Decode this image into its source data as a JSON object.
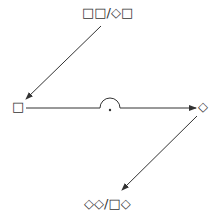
{
  "diagram": {
    "top_label": "□□/◇□",
    "bottom_label": "◇◇/□◇",
    "left_node": "□",
    "right_node": "◇",
    "arrows": [
      {
        "from": "top_label",
        "to": "left_node"
      },
      {
        "from": "left_node",
        "to": "right_node",
        "decoration": "semicircle-with-dot"
      },
      {
        "from": "right_node",
        "to": "bottom_label"
      }
    ],
    "stroke_color": "#333333"
  }
}
